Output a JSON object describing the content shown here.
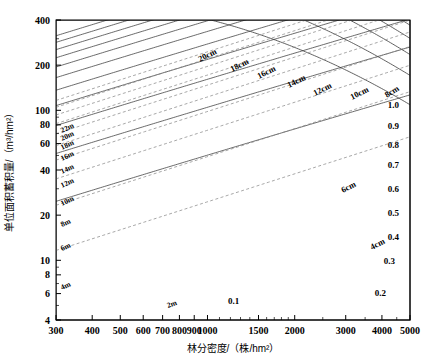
{
  "chart_data": {
    "type": "line",
    "title": "",
    "xlabel": "林分密度/（株/hm²）",
    "ylabel": "单位面积蓄积量/（m³/hm²）",
    "xscale": "log",
    "yscale": "log",
    "xlim": [
      300,
      5000
    ],
    "ylim": [
      4,
      400
    ],
    "grid": false,
    "xticks": [
      300,
      400,
      500,
      600,
      700,
      800,
      900,
      1000,
      1500,
      2000,
      3000,
      4000,
      5000
    ],
    "xticklabels": [
      "300",
      "400",
      "500",
      "600",
      "700",
      "800",
      "900",
      "1000",
      "1500",
      "2000",
      "3000",
      "4000",
      "5000"
    ],
    "yticks": [
      4,
      6,
      8,
      10,
      20,
      40,
      60,
      80,
      100,
      200,
      400
    ],
    "yticklabels": [
      "4",
      "6",
      "8",
      "10",
      "20",
      "40",
      "60",
      "80",
      "100",
      "200",
      "400"
    ],
    "series": [
      {
        "name": "height-curves",
        "kind": "height",
        "unit": "m",
        "style": "solid",
        "labels": [
          "2m",
          "4m",
          "6m",
          "8m",
          "10m",
          "12m",
          "14m",
          "16m",
          "18m",
          "20m",
          "22m"
        ],
        "values": [
          2,
          4,
          6,
          8,
          10,
          12,
          14,
          16,
          18,
          20,
          22
        ]
      },
      {
        "name": "diameter-curves",
        "kind": "diameter",
        "unit": "cm",
        "style": "solid",
        "labels": [
          "4cm",
          "6cm",
          "8cm",
          "10cm",
          "12cm",
          "14cm",
          "16cm",
          "18cm",
          "20cm"
        ],
        "values": [
          4,
          6,
          8,
          10,
          12,
          14,
          16,
          18,
          20
        ]
      },
      {
        "name": "density-index-lines",
        "kind": "density-index",
        "style": "dashed",
        "labels": [
          "0.1",
          "0.2",
          "0.3",
          "0.4",
          "0.5",
          "0.6",
          "0.7",
          "0.8",
          "0.9",
          "1.0"
        ],
        "values": [
          0.1,
          0.2,
          0.3,
          0.4,
          0.5,
          0.6,
          0.7,
          0.8,
          0.9,
          1.0
        ]
      }
    ],
    "annotations": {
      "height_labels_left": [
        "22m",
        "20m",
        "18m",
        "16m",
        "14m",
        "12m",
        "10m",
        "8m",
        "6m",
        "4m"
      ],
      "height_label_bottom": "2m",
      "diameter_labels_top": [
        "20cm",
        "18cm",
        "16cm",
        "14cm",
        "12cm",
        "10cm",
        "8cm"
      ],
      "diameter_labels_mid": [
        "6cm",
        "4cm"
      ],
      "density_labels_right": [
        "1.0",
        "0.9",
        "0.8",
        "0.7",
        "0.6",
        "0.5",
        "0.4",
        "0.3",
        "0.2"
      ],
      "density_label_bottom": "0.1"
    },
    "colors": {
      "axis": "#000000",
      "solid_curve": "#333333",
      "dashed_curve": "#777777",
      "background": "#ffffff"
    }
  }
}
